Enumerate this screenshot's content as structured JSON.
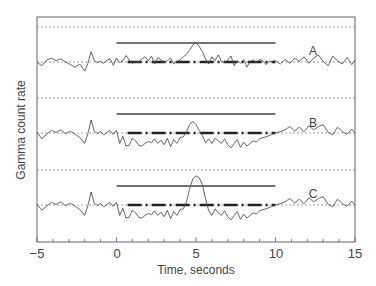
{
  "chart_data": {
    "type": "line",
    "title": "",
    "xlabel": "Time, seconds",
    "ylabel": "Gamma count rate",
    "xlim": [
      -5,
      15
    ],
    "x_ticks": [
      -5,
      0,
      5,
      10,
      15
    ],
    "x_tick_labels": [
      "−5",
      "0",
      "5",
      "10",
      "15"
    ],
    "x_minor_tick_step": 1,
    "y_ticks_labeled": false,
    "grid": "dotted horizontal baselines per panel",
    "legend": "none; inline labels A, B, C at right",
    "panels": [
      {
        "label": "A",
        "baseline_y_px": 62,
        "upper_dotted_y_px": 27,
        "bar_solid": {
          "x_start": 0,
          "x_end": 10
        },
        "bar_dashdot": {
          "x_start": 0.7,
          "x_end": 10
        },
        "description": "Noise around baseline; single spike near t=5s rising above the solid bar; signal returns to baseline fluctuation",
        "x": [
          -5,
          -4.7,
          -4.4,
          -4.1,
          -3.8,
          -3.5,
          -3.2,
          -2.9,
          -2.6,
          -2.3,
          -2,
          -1.8,
          -1.6,
          -1.4,
          -1.2,
          -1,
          -0.8,
          -0.6,
          -0.4,
          -0.2,
          0,
          0.2,
          0.4,
          0.6,
          0.8,
          1,
          1.2,
          1.4,
          1.6,
          1.8,
          2,
          2.2,
          2.4,
          2.6,
          2.8,
          3,
          3.2,
          3.4,
          3.6,
          3.8,
          4,
          4.2,
          4.4,
          4.6,
          4.8,
          5,
          5.2,
          5.4,
          5.6,
          5.8,
          6,
          6.2,
          6.4,
          6.6,
          6.8,
          7,
          7.2,
          7.4,
          7.6,
          7.8,
          8,
          8.2,
          8.4,
          8.6,
          8.8,
          9,
          9.2,
          9.4,
          9.6,
          9.8,
          10,
          10.3,
          10.6,
          10.9,
          11.2,
          11.5,
          11.8,
          12.1,
          12.4,
          12.7,
          13,
          13.3,
          13.6,
          13.9,
          14.2,
          14.5,
          14.8,
          15
        ],
        "y": [
          0,
          -0.6,
          0.3,
          0.6,
          0.2,
          0.5,
          0,
          -0.4,
          -0.8,
          -0.3,
          -1.4,
          -0.2,
          1.6,
          0.2,
          -0.1,
          0.1,
          -0.2,
          0.3,
          0.5,
          -0.5,
          0.6,
          -0.1,
          0.2,
          1.0,
          0.3,
          -0.2,
          0.1,
          -0.1,
          0.5,
          0.8,
          0.2,
          0.9,
          -0.3,
          0.7,
          0.3,
          -0.1,
          0.2,
          0.6,
          -0.3,
          0.1,
          0.3,
          0.8,
          1.2,
          1.8,
          2.6,
          3.0,
          2.4,
          1.6,
          0.5,
          -0.3,
          0.8,
          0.2,
          1.1,
          0.1,
          -0.1,
          0.3,
          0.9,
          -0.6,
          0.2,
          -0.2,
          0.4,
          -0.8,
          0.1,
          0.3,
          -0.1,
          0.4,
          0.2,
          -0.4,
          0.1,
          0.1,
          0.2,
          -0.3,
          0.4,
          -0.2,
          0.6,
          0.1,
          0.8,
          -0.2,
          0.6,
          1.1,
          0.1,
          -0.6,
          0.9,
          0.2,
          -0.3,
          0.7,
          -0.4,
          0.3
        ]
      },
      {
        "label": "B",
        "baseline_y_px": 133,
        "upper_dotted_y_px": 98,
        "bar_solid": {
          "x_start": 0,
          "x_end": 10
        },
        "bar_dashdot": {
          "x_start": 0.7,
          "x_end": 10
        },
        "description": "Noise around baseline; signal drops below baseline between 0 and 10 s with small bump near t=5s",
        "x": [
          -5,
          -4.7,
          -4.4,
          -4.1,
          -3.8,
          -3.5,
          -3.2,
          -2.9,
          -2.6,
          -2.3,
          -2,
          -1.8,
          -1.6,
          -1.4,
          -1.2,
          -1,
          -0.8,
          -0.6,
          -0.4,
          -0.2,
          0,
          0.2,
          0.4,
          0.6,
          0.8,
          1,
          1.2,
          1.4,
          1.6,
          1.8,
          2,
          2.2,
          2.4,
          2.6,
          2.8,
          3,
          3.2,
          3.4,
          3.6,
          3.8,
          4,
          4.2,
          4.4,
          4.6,
          4.8,
          5,
          5.2,
          5.4,
          5.6,
          5.8,
          6,
          6.2,
          6.4,
          6.6,
          6.8,
          7,
          7.2,
          7.4,
          7.6,
          7.8,
          8,
          8.2,
          8.4,
          8.6,
          8.8,
          9,
          9.2,
          9.4,
          9.6,
          9.8,
          10,
          10.3,
          10.6,
          10.9,
          11.2,
          11.5,
          11.8,
          12.1,
          12.4,
          12.7,
          13,
          13.3,
          13.6,
          13.9,
          14.2,
          14.5,
          14.8,
          15
        ],
        "y": [
          0.1,
          -0.9,
          -0.2,
          0.4,
          0.1,
          0.5,
          -0.1,
          0.3,
          -0.2,
          -0.7,
          -1.6,
          -0.1,
          2.0,
          0.3,
          -0.1,
          0.2,
          -0.3,
          0.1,
          0.4,
          -0.2,
          0.4,
          -1.6,
          -0.5,
          -2.0,
          -1.9,
          -0.8,
          -1.2,
          -1.9,
          -2.0,
          -1.6,
          -1.3,
          -1.5,
          -0.9,
          -1.6,
          -1.1,
          -1.8,
          -0.8,
          -2.1,
          -1.0,
          -1.6,
          -0.7,
          -0.6,
          0.2,
          1.3,
          1.8,
          1.3,
          0.4,
          -0.4,
          -1.5,
          -0.9,
          -1.6,
          -0.8,
          -1.2,
          -1.6,
          -0.9,
          -1.8,
          -2.3,
          -1.6,
          -1.0,
          -2.2,
          -1.4,
          -2.0,
          -1.6,
          -1.2,
          -1.4,
          -0.9,
          -0.7,
          -0.6,
          -0.4,
          -0.2,
          0.0,
          0.2,
          0.5,
          1.0,
          0.3,
          0.9,
          0.2,
          1.1,
          0.5,
          1.0,
          1.3,
          0.1,
          -0.3,
          0.9,
          0.2,
          -0.2,
          0.6,
          0.0
        ]
      },
      {
        "label": "C",
        "baseline_y_px": 205,
        "upper_dotted_y_px": 170,
        "bar_solid": {
          "x_start": 0,
          "x_end": 10
        },
        "bar_dashdot": {
          "x_start": 0.7,
          "x_end": 10
        },
        "description": "Noise around baseline; signal drops below baseline between 0 and 10 s with large spike near t=5s exceeding the solid bar",
        "x": [
          -5,
          -4.7,
          -4.4,
          -4.1,
          -3.8,
          -3.5,
          -3.2,
          -2.9,
          -2.6,
          -2.3,
          -2,
          -1.8,
          -1.6,
          -1.4,
          -1.2,
          -1,
          -0.8,
          -0.6,
          -0.4,
          -0.2,
          0,
          0.2,
          0.4,
          0.6,
          0.8,
          1,
          1.2,
          1.4,
          1.6,
          1.8,
          2,
          2.2,
          2.4,
          2.6,
          2.8,
          3,
          3.2,
          3.4,
          3.6,
          3.8,
          4,
          4.2,
          4.4,
          4.6,
          4.8,
          5,
          5.2,
          5.4,
          5.6,
          5.8,
          6,
          6.2,
          6.4,
          6.6,
          6.8,
          7,
          7.2,
          7.4,
          7.6,
          7.8,
          8,
          8.2,
          8.4,
          8.6,
          8.8,
          9,
          9.2,
          9.4,
          9.6,
          9.8,
          10,
          10.3,
          10.6,
          10.9,
          11.2,
          11.5,
          11.8,
          12.1,
          12.4,
          12.7,
          13,
          13.3,
          13.6,
          13.9,
          14.2,
          14.5,
          14.8,
          15
        ],
        "y": [
          0.1,
          -0.8,
          -0.2,
          0.4,
          0.1,
          0.5,
          -0.1,
          0.3,
          -0.2,
          -0.7,
          -1.6,
          -0.1,
          2.0,
          0.3,
          -0.1,
          0.2,
          -0.3,
          0.1,
          0.4,
          -0.2,
          0.4,
          -1.6,
          -0.5,
          -2.0,
          -1.9,
          -0.8,
          -1.2,
          -1.9,
          -2.0,
          -1.6,
          -1.3,
          -1.5,
          -0.9,
          -1.6,
          -1.1,
          -1.8,
          -0.8,
          -2.1,
          -1.0,
          -1.6,
          -0.7,
          -0.6,
          0.5,
          2.5,
          4.0,
          4.5,
          4.2,
          3.1,
          1.0,
          -0.9,
          -1.6,
          -0.6,
          -1.2,
          -1.6,
          -0.9,
          -1.8,
          -2.3,
          -1.6,
          -1.0,
          -2.2,
          -1.4,
          -2.0,
          -1.6,
          -1.2,
          -1.4,
          -0.9,
          -0.7,
          -0.6,
          -0.4,
          -0.2,
          0.0,
          0.2,
          0.5,
          1.0,
          0.3,
          0.9,
          0.2,
          1.1,
          0.5,
          1.0,
          1.3,
          0.1,
          -0.3,
          0.9,
          0.2,
          -0.2,
          0.6,
          0.0
        ]
      }
    ],
    "colors": {
      "trace": "#555555",
      "frame": "#666666",
      "dotted": "#888888",
      "bar": "#444444"
    }
  },
  "labels": {
    "xlabel": "Time, seconds",
    "ylabel": "Gamma count rate",
    "series": [
      "A",
      "B",
      "C"
    ],
    "x_ticks": [
      "−5",
      "0",
      "5",
      "10",
      "15"
    ]
  }
}
